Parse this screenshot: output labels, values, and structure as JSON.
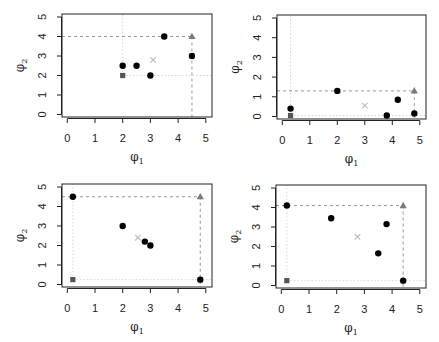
{
  "figure": {
    "layout": "2x2 grid of scatter panels",
    "colors": {
      "points": "#000000",
      "square_marker": "#555555",
      "triangle_marker": "#7a7a7a",
      "cross_marker": "#bbbbbb",
      "dashed_reference": "#999999",
      "dotted_reference": "#d6d6d6",
      "axis": "#222222"
    }
  },
  "chart_data": [
    {
      "type": "scatter",
      "panel": "top-left",
      "title": "",
      "xlabel": "φ1",
      "ylabel": "φ2",
      "xlim": [
        0,
        5
      ],
      "ylim": [
        0,
        5
      ],
      "xticks": [
        "0",
        "1",
        "2",
        "3",
        "4",
        "5"
      ],
      "yticks": [
        "0",
        "1",
        "2",
        "3",
        "4",
        "5"
      ],
      "grid": false,
      "series": [
        {
          "name": "points",
          "marker": "filled-circle",
          "x": [
            2,
            2.5,
            3,
            3.5,
            4.5
          ],
          "y": [
            2.5,
            2.5,
            2,
            4,
            3
          ]
        },
        {
          "name": "square_marker",
          "marker": "square",
          "x": [
            2
          ],
          "y": [
            2
          ]
        },
        {
          "name": "triangle_marker",
          "marker": "triangle",
          "x": [
            4.5
          ],
          "y": [
            4
          ]
        },
        {
          "name": "cross_marker",
          "marker": "cross",
          "x": [
            3.1
          ],
          "y": [
            2.8
          ]
        }
      ]
    },
    {
      "type": "scatter",
      "panel": "top-right",
      "title": "",
      "xlabel": "φ1",
      "ylabel": "φ2",
      "xlim": [
        0,
        5
      ],
      "ylim": [
        0,
        5
      ],
      "xticks": [
        "0",
        "1",
        "2",
        "3",
        "4",
        "5"
      ],
      "yticks": [
        "0",
        "1",
        "2",
        "3",
        "4",
        "5"
      ],
      "grid": false,
      "series": [
        {
          "name": "points",
          "marker": "filled-circle",
          "x": [
            0.3,
            2,
            3.8,
            4.2,
            4.8
          ],
          "y": [
            0.4,
            1.3,
            0.05,
            0.85,
            0.15
          ]
        },
        {
          "name": "square_marker",
          "marker": "square",
          "x": [
            0.3
          ],
          "y": [
            0.05
          ]
        },
        {
          "name": "triangle_marker",
          "marker": "triangle",
          "x": [
            4.8
          ],
          "y": [
            1.3
          ]
        },
        {
          "name": "cross_marker",
          "marker": "cross",
          "x": [
            3.0
          ],
          "y": [
            0.55
          ]
        }
      ]
    },
    {
      "type": "scatter",
      "panel": "bottom-left",
      "title": "",
      "xlabel": "φ1",
      "ylabel": "φ2",
      "xlim": [
        0,
        5
      ],
      "ylim": [
        0,
        5
      ],
      "xticks": [
        "0",
        "1",
        "2",
        "3",
        "4",
        "5"
      ],
      "yticks": [
        "0",
        "1",
        "2",
        "3",
        "4",
        "5"
      ],
      "grid": false,
      "series": [
        {
          "name": "points",
          "marker": "filled-circle",
          "x": [
            0.2,
            2,
            2.8,
            3,
            4.8
          ],
          "y": [
            4.5,
            3,
            2.2,
            2,
            0.25
          ]
        },
        {
          "name": "square_marker",
          "marker": "square",
          "x": [
            0.2
          ],
          "y": [
            0.25
          ]
        },
        {
          "name": "triangle_marker",
          "marker": "triangle",
          "x": [
            4.8
          ],
          "y": [
            4.5
          ]
        },
        {
          "name": "cross_marker",
          "marker": "cross",
          "x": [
            2.55
          ],
          "y": [
            2.4
          ]
        }
      ]
    },
    {
      "type": "scatter",
      "panel": "bottom-right",
      "title": "",
      "xlabel": "φ1",
      "ylabel": "φ2",
      "xlim": [
        0,
        5
      ],
      "ylim": [
        0,
        5
      ],
      "xticks": [
        "0",
        "1",
        "2",
        "3",
        "4",
        "5"
      ],
      "yticks": [
        "0",
        "1",
        "2",
        "3",
        "4",
        "5"
      ],
      "grid": false,
      "series": [
        {
          "name": "points",
          "marker": "filled-circle",
          "x": [
            0.2,
            1.8,
            3.5,
            3.8,
            4.4
          ],
          "y": [
            4.1,
            3.45,
            1.65,
            3.15,
            0.25
          ]
        },
        {
          "name": "square_marker",
          "marker": "square",
          "x": [
            0.2
          ],
          "y": [
            0.25
          ]
        },
        {
          "name": "triangle_marker",
          "marker": "triangle",
          "x": [
            4.4
          ],
          "y": [
            4.1
          ]
        },
        {
          "name": "cross_marker",
          "marker": "cross",
          "x": [
            2.75
          ],
          "y": [
            2.5
          ]
        }
      ]
    }
  ]
}
